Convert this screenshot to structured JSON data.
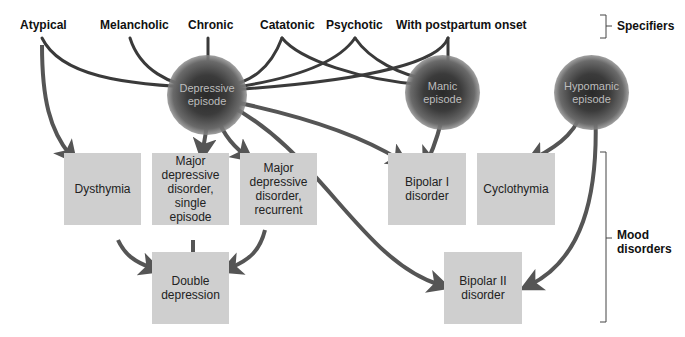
{
  "specifiers": {
    "label": "Specifiers",
    "items": [
      "Atypical",
      "Melancholic",
      "Chronic",
      "Catatonic",
      "Psychotic",
      "With postpartum onset"
    ]
  },
  "episodes": {
    "depressive": "Depressive episode",
    "manic": "Manic episode",
    "hypomanic": "Hypomanic episode"
  },
  "disorders": {
    "label": "Mood disorders",
    "dysthymia": "Dysthymia",
    "mdd_single": "Major depressive disorder, single episode",
    "mdd_recurrent": "Major depressive disorder, recurrent",
    "bipolar1": "Bipolar I disorder",
    "cyclothymia": "Cyclothymia",
    "double_depression": "Double depression",
    "bipolar2": "Bipolar II disorder"
  },
  "colors": {
    "box_fill": "#cfcfcf",
    "arrow": "#555555",
    "line": "#3a3a3a"
  }
}
